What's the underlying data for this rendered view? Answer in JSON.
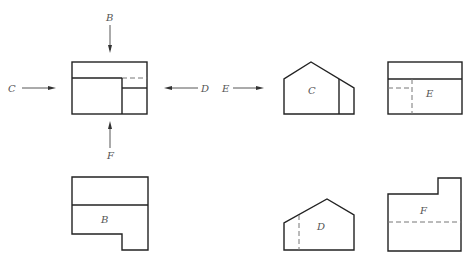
{
  "diagram": {
    "type": "orthographic-projection",
    "colors": {
      "line": "#222222",
      "hidden_line": "#777777",
      "label": "#555555",
      "background": "#ffffff"
    },
    "main_view": {
      "direction_labels": {
        "top": "B",
        "left": "C",
        "right": "D",
        "bottom": "F"
      }
    },
    "entry_arrow_label": "E",
    "views": [
      {
        "id": "C",
        "label": "C"
      },
      {
        "id": "E",
        "label": "E"
      },
      {
        "id": "B",
        "label": "B"
      },
      {
        "id": "D",
        "label": "D"
      },
      {
        "id": "F",
        "label": "F"
      }
    ]
  }
}
